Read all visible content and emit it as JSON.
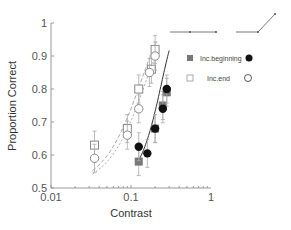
{
  "chart_data": {
    "type": "scatter",
    "title": "",
    "xlabel": "Contrast",
    "ylabel": "Proportion Correct",
    "xscale": "log",
    "xlim": [
      0.01,
      1
    ],
    "ylim": [
      0.5,
      1
    ],
    "xticks": [
      "0.01",
      "0.1",
      "1"
    ],
    "yticks": [
      "0.5",
      "0.6",
      "0.7",
      "0.8",
      "0.9",
      "1"
    ],
    "grid": false,
    "legend": {
      "position": "upper right",
      "entries": [
        {
          "label": "Inc.beginning",
          "markers": [
            "filled-square",
            "filled-circle"
          ]
        },
        {
          "label": "Inc.end",
          "markers": [
            "open-square",
            "open-circle"
          ]
        }
      ],
      "icons": [
        "flat-then-flat line",
        "flat-then-rising line"
      ]
    },
    "series": [
      {
        "name": "Inc.end (square)",
        "marker": "open-square",
        "x": [
          0.035,
          0.09,
          0.125,
          0.18,
          0.2
        ],
        "y": [
          0.63,
          0.68,
          0.8,
          0.86,
          0.92
        ]
      },
      {
        "name": "Inc.end (circle)",
        "marker": "open-circle",
        "x": [
          0.035,
          0.09,
          0.125,
          0.17,
          0.2
        ],
        "y": [
          0.59,
          0.66,
          0.74,
          0.85,
          0.9
        ]
      },
      {
        "name": "Inc.beginning (square)",
        "marker": "filled-square",
        "x": [
          0.125,
          0.2,
          0.25,
          0.28
        ],
        "y": [
          0.58,
          0.68,
          0.75,
          0.79
        ]
      },
      {
        "name": "Inc.beginning (circle)",
        "marker": "filled-circle",
        "x": [
          0.125,
          0.16,
          0.2,
          0.25,
          0.28
        ],
        "y": [
          0.625,
          0.605,
          0.68,
          0.74,
          0.8
        ]
      }
    ]
  },
  "axes": {
    "xlabel": "Contrast",
    "ylabel": "Proportion Correct",
    "xticks": [
      {
        "v": 0.01,
        "l": "0.01"
      },
      {
        "v": 0.1,
        "l": "0.1"
      },
      {
        "v": 1,
        "l": "1"
      }
    ],
    "yticks": [
      {
        "v": 0.5,
        "l": "0.5"
      },
      {
        "v": 0.6,
        "l": "0.6"
      },
      {
        "v": 0.7,
        "l": "0.7"
      },
      {
        "v": 0.8,
        "l": "0.8"
      },
      {
        "v": 0.9,
        "l": "0.9"
      },
      {
        "v": 1,
        "l": "1"
      }
    ]
  },
  "legend": {
    "row1": "Inc.beginning",
    "row2": "Inc.end"
  },
  "colors": {
    "axis": "#999999",
    "filled_square": "#777777",
    "filled_circle": "#111111",
    "open": "#888888",
    "fit_dashed": "#aaaaaa",
    "fit_solid": "#333333"
  }
}
